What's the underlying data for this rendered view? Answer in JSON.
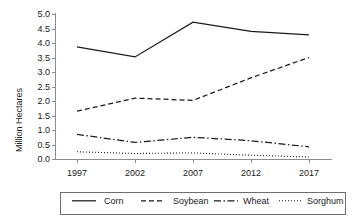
{
  "chart_data": {
    "type": "line",
    "title": "",
    "xlabel": "",
    "ylabel": "Million Hectares",
    "x": [
      1997,
      2002,
      2007,
      2012,
      2017
    ],
    "xtick_labels": [
      "1997",
      "2002",
      "2007",
      "2012",
      "2017"
    ],
    "ytick_labels": [
      "0.0",
      "0.5",
      "1.0",
      "1.5",
      "2.0",
      "2.5",
      "3.0",
      "3.5",
      "4.0",
      "4.5",
      "5.0"
    ],
    "ylim": [
      0.0,
      5.0
    ],
    "ytick_step": 0.5,
    "grid": false,
    "legend_position": "bottom",
    "series": [
      {
        "name": "Corn",
        "style": "solid",
        "values": [
          3.87,
          3.52,
          4.72,
          4.4,
          4.28
        ]
      },
      {
        "name": "Soybean",
        "style": "dashed",
        "values": [
          1.65,
          2.1,
          2.02,
          2.8,
          3.5
        ]
      },
      {
        "name": "Wheat",
        "style": "dash-dot",
        "values": [
          0.85,
          0.57,
          0.75,
          0.63,
          0.42
        ]
      },
      {
        "name": "Sorghum",
        "style": "dotted",
        "values": [
          0.25,
          0.19,
          0.21,
          0.13,
          0.07
        ]
      }
    ]
  },
  "axis": {
    "y_title": "Million Hectares"
  },
  "legend": {
    "items": [
      {
        "label": "Corn"
      },
      {
        "label": "Soybean"
      },
      {
        "label": "Wheat"
      },
      {
        "label": "Sorghum"
      }
    ]
  },
  "colors": {
    "line": "#1a1a1a",
    "axis": "#8c8c8c",
    "legend_border": "#6e6e6e",
    "background": "#ffffff"
  }
}
